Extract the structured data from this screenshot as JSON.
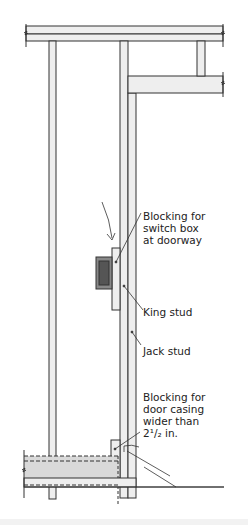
{
  "diagram": {
    "type": "wall-framing-section",
    "colors": {
      "line": "#333333",
      "fill_light": "#eeeeee",
      "fill_floor": "#d9d9d9",
      "switch_box": "#666666",
      "background": "#ffffff"
    },
    "labels": {
      "blocking_switch": "Blocking for\nswitch box\nat doorway",
      "king_stud": "King stud",
      "jack_stud": "Jack stud",
      "blocking_casing": "Blocking for\ndoor casing\nwider than\n2¹/₂ in."
    }
  }
}
